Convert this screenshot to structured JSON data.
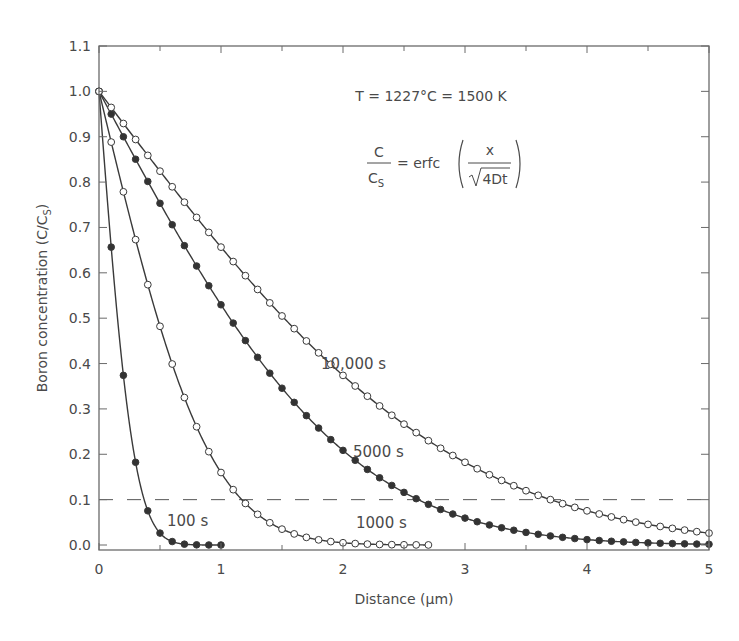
{
  "chart_data": {
    "type": "line",
    "title": "",
    "xlabel": "Distance (µm)",
    "ylabel": "Boron concentration (C/C_S)",
    "ylabel_main": "Boron concentration (C/C",
    "ylabel_sub": "S",
    "ylabel_close": ")",
    "xlim": [
      0,
      5
    ],
    "ylim": [
      0,
      1.1
    ],
    "x_ticks": [
      0,
      1,
      2,
      3,
      4,
      5
    ],
    "x_tick_labels": [
      "0",
      "1",
      "2",
      "3",
      "4",
      "5"
    ],
    "y_ticks": [
      0.0,
      0.1,
      0.2,
      0.3,
      0.4,
      0.5,
      0.6,
      0.7,
      0.8,
      0.9,
      1.0,
      1.1
    ],
    "y_tick_labels": [
      "0.0",
      "0.1",
      "0.2",
      "0.3",
      "0.4",
      "0.5",
      "0.6",
      "0.7",
      "0.8",
      "0.9",
      "1.0",
      "1.1"
    ],
    "grid": false,
    "legend": "none (curves labeled inline)",
    "reference_line": {
      "y": 0.1,
      "style": "dashed"
    },
    "annotations": {
      "temperature": "T = 1227°C = 1500 K",
      "equation_lhs_num": "C",
      "equation_lhs_den": "C",
      "equation_lhs_den_sub": "S",
      "equation_eq": "= erfc",
      "equation_rhs_num": "x",
      "equation_rhs_den": "4Dt"
    },
    "model": "C/Cs = erfc(x / sqrt(4Dt))",
    "four_D_um2_per_s": 0.001012,
    "point_spacing_um": 0.1,
    "series": [
      {
        "name": "100 s",
        "t": 100,
        "marker": "filled",
        "x_max": 1.0,
        "label": "100 s",
        "label_pos": [
          0.5,
          0.06
        ]
      },
      {
        "name": "1000 s",
        "t": 1000,
        "marker": "open",
        "x_max": 2.7,
        "label": "1000 s",
        "label_pos": [
          1.6,
          0.06
        ]
      },
      {
        "name": "5000 s",
        "t": 5000,
        "marker": "filled",
        "x_max": 5.0,
        "label": "5000 s",
        "label_pos": [
          2.6,
          0.2
        ]
      },
      {
        "name": "10,000 s",
        "t": 10000,
        "marker": "open",
        "x_max": 5.0,
        "label": "10,000 s",
        "label_pos": [
          3.0,
          0.4
        ]
      }
    ],
    "sample_values": {
      "100 s": {
        "x": [
          0,
          0.1,
          0.2,
          0.3,
          0.4,
          0.5,
          0.6,
          0.7,
          0.8,
          0.9,
          1.0
        ],
        "y": [
          1.0,
          0.66,
          0.37,
          0.18,
          0.08,
          0.03,
          0.01,
          0.0,
          0.0,
          0.0,
          0.0
        ]
      },
      "1000 s": {
        "x": [
          0,
          0.5,
          1.0,
          1.5,
          2.0,
          2.5
        ],
        "y": [
          1.0,
          0.48,
          0.16,
          0.04,
          0.01,
          0.0
        ]
      },
      "5000 s": {
        "x": [
          0,
          1,
          2,
          3,
          4,
          5
        ],
        "y": [
          1.0,
          0.53,
          0.21,
          0.06,
          0.01,
          0.0
        ]
      },
      "10,000 s": {
        "x": [
          0,
          1,
          2,
          3,
          4,
          5
        ],
        "y": [
          1.0,
          0.65,
          0.37,
          0.18,
          0.08,
          0.03
        ]
      }
    },
    "colors": {
      "line": "#3a3a3a",
      "frame": "#6a6a6a",
      "text": "#4a4a4a",
      "filled_marker": "#333333",
      "open_marker_fill": "#ffffff"
    }
  }
}
